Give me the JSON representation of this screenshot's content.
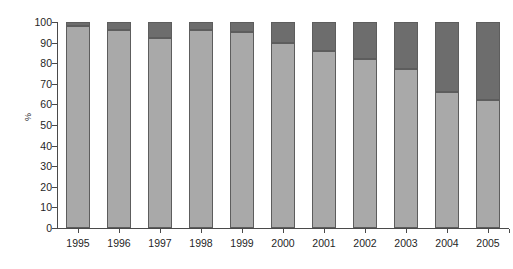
{
  "chart_data": {
    "type": "bar",
    "title": "",
    "subtitle": "",
    "xlabel": "",
    "ylabel": "%",
    "ylim": [
      0,
      100
    ],
    "xlim_categories": 11,
    "grid": false,
    "legend": "none",
    "stacked": true,
    "categories": [
      "1995",
      "1996",
      "1997",
      "1998",
      "1999",
      "2000",
      "2001",
      "2002",
      "2003",
      "2004",
      "2005"
    ],
    "series": [
      {
        "name": "lower-segment",
        "color": "#a9a9a9",
        "values": [
          98,
          96,
          92,
          96,
          95,
          90,
          86,
          82,
          77,
          66,
          62
        ]
      },
      {
        "name": "upper-segment",
        "color": "#6d6d6d",
        "values": [
          2,
          4,
          8,
          4,
          5,
          10,
          14,
          18,
          23,
          34,
          38
        ]
      }
    ],
    "ytick_labels": [
      "100",
      "90",
      "80",
      "70",
      "60",
      "50",
      "40",
      "30",
      "20",
      "10",
      "0"
    ],
    "ytick_values": [
      100,
      90,
      80,
      70,
      60,
      50,
      40,
      30,
      20,
      10,
      0
    ],
    "xtick_labels": [
      "1995",
      "1996",
      "1997",
      "1998",
      "1999",
      "2000",
      "2001",
      "2002",
      "2003",
      "2004",
      "2005"
    ],
    "annotations": []
  },
  "colors": {
    "background": "#ffffff",
    "axis": "#4a4a4a",
    "text": "#1f1f1f",
    "segment_lower": "#a9a9a9",
    "segment_upper": "#6d6d6d",
    "bar_outline": "#5d5d5d"
  }
}
